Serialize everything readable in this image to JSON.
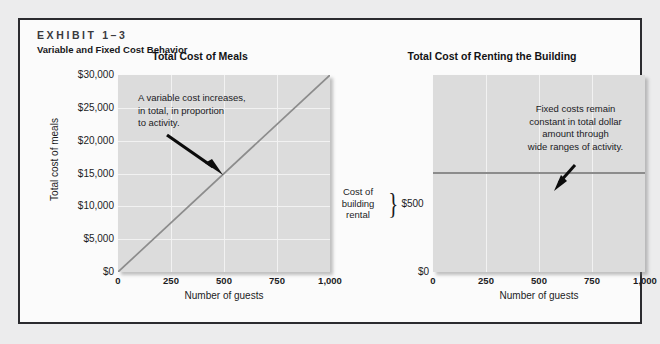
{
  "exhibit": {
    "number": "EXHIBIT 1–3",
    "subtitle": "Variable and Fixed Cost Behavior"
  },
  "charts": [
    {
      "id": "total-cost-of-meals",
      "title": "Total Cost of Meals",
      "annotation": "A variable cost increases,\nin total, in proportion\nto activity.",
      "xlabel": "Number of guests",
      "ylabel": "Total cost of meals",
      "xticks": [
        "0",
        "250",
        "500",
        "750",
        "1,000"
      ],
      "yticks": [
        "$30,000",
        "$25,000",
        "$20,000",
        "$15,000",
        "$10,000",
        "$5,000",
        "$0"
      ]
    },
    {
      "id": "total-cost-of-renting-the-building",
      "title": "Total Cost of Renting the Building",
      "annotation": "Fixed costs remain\nconstant in total dollar\namount through\nwide ranges of activity.",
      "xlabel": "Number of guests",
      "bracket_label": "Cost of\nbuilding\nrental",
      "bracket_value": "$500",
      "zero_tick": "$0",
      "xticks": [
        "0",
        "250",
        "500",
        "750",
        "1,000"
      ]
    }
  ],
  "colors": {
    "plot_background": "#dcdcdc",
    "gridline": "#f2f2f2",
    "data_line": "#8c8c8c",
    "frame_border": "#2b2b2f",
    "page_background": "#fbfbfb",
    "text": "#1b1b1e"
  },
  "chart_data": [
    {
      "type": "line",
      "title": "Total Cost of Meals",
      "xlabel": "Number of guests",
      "ylabel": "Total cost of meals",
      "xlim": [
        0,
        1000
      ],
      "ylim": [
        0,
        30000
      ],
      "xticks": [
        0,
        250,
        500,
        750,
        1000
      ],
      "xticklabels": [
        "0",
        "250",
        "500",
        "750",
        "1,000"
      ],
      "yticks": [
        0,
        5000,
        10000,
        15000,
        20000,
        25000,
        30000
      ],
      "yticklabels": [
        "$0",
        "$5,000",
        "$10,000",
        "$15,000",
        "$20,000",
        "$25,000",
        "$30,000"
      ],
      "grid": true,
      "legend": "none",
      "series": [
        {
          "name": "Total cost of meals",
          "color": "#8c8c8c",
          "x": [
            0,
            250,
            500,
            750,
            1000
          ],
          "values": [
            0,
            7500,
            15000,
            22500,
            30000
          ]
        }
      ],
      "annotations": [
        {
          "text": "A variable cost increases, in total, in proportion to activity.",
          "points_to_x": 500,
          "points_to_y": 15000
        }
      ]
    },
    {
      "type": "line",
      "title": "Total Cost of Renting the Building",
      "xlabel": "Number of guests",
      "ylabel": "",
      "xlim": [
        0,
        1000
      ],
      "ylim": [
        0,
        1000
      ],
      "xticks": [
        0,
        250,
        500,
        750,
        1000
      ],
      "xticklabels": [
        "0",
        "250",
        "500",
        "750",
        "1,000"
      ],
      "yticks": [
        0,
        500
      ],
      "yticklabels": [
        "$0",
        "$500"
      ],
      "grid": true,
      "legend": "none",
      "series": [
        {
          "name": "Cost of building rental",
          "color": "#8c8c8c",
          "x": [
            0,
            250,
            500,
            750,
            1000
          ],
          "values": [
            500,
            500,
            500,
            500,
            500
          ]
        }
      ],
      "annotations": [
        {
          "text": "Fixed costs remain constant in total dollar amount through wide ranges of activity.",
          "points_to_x": 650,
          "points_to_y": 500
        },
        {
          "text": "Cost of building rental",
          "points_to_x": 0,
          "points_to_y": 500
        }
      ]
    }
  ]
}
